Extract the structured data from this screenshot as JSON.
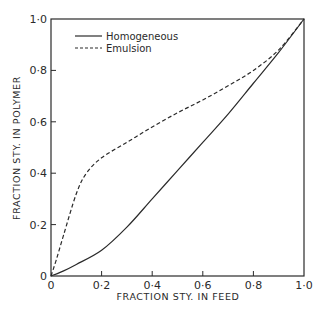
{
  "chart_data": {
    "type": "line",
    "title": "",
    "xlabel": "FRACTION  STY. IN  FEED",
    "ylabel": "FRACTION  STY. IN  POLYMER",
    "xlim": [
      0,
      1.0
    ],
    "ylim": [
      0,
      1.0
    ],
    "grid": false,
    "legend_position": "upper-left",
    "x_ticks": [
      "0",
      "0·2",
      "0·4",
      "0·6",
      "0·8",
      "1·0"
    ],
    "y_ticks": [
      "0",
      "0·2",
      "0·4",
      "0·6",
      "0·8",
      "1·0"
    ],
    "series": [
      {
        "name": "Homogeneous",
        "style": "solid",
        "x": [
          0,
          0.05,
          0.1,
          0.2,
          0.3,
          0.4,
          0.5,
          0.6,
          0.7,
          0.8,
          0.9,
          1.0
        ],
        "y": [
          0,
          0.02,
          0.045,
          0.1,
          0.19,
          0.3,
          0.41,
          0.52,
          0.63,
          0.75,
          0.87,
          1.0
        ]
      },
      {
        "name": "Emulsion",
        "style": "dashed",
        "x": [
          0,
          0.02,
          0.05,
          0.1,
          0.14,
          0.2,
          0.3,
          0.4,
          0.5,
          0.6,
          0.7,
          0.8,
          0.9,
          1.0
        ],
        "y": [
          0,
          0.06,
          0.16,
          0.32,
          0.4,
          0.46,
          0.52,
          0.58,
          0.635,
          0.685,
          0.74,
          0.8,
          0.88,
          1.0
        ]
      }
    ]
  },
  "legend": {
    "items": [
      {
        "label": "Homogeneous",
        "style": "solid"
      },
      {
        "label": "Emulsion",
        "style": "dashed"
      }
    ]
  },
  "axes": {
    "x_label": "FRACTION  STY. IN  FEED",
    "y_label": "FRACTION  STY. IN  POLYMER",
    "x_ticks": [
      "0",
      "0·2",
      "0·4",
      "0·6",
      "0·8",
      "1·0"
    ],
    "y_ticks": [
      "0",
      "0·2",
      "0·4",
      "0·6",
      "0·8",
      "1·0"
    ]
  },
  "colors": {
    "ink": "#2a2a2a",
    "background": "#ffffff"
  }
}
